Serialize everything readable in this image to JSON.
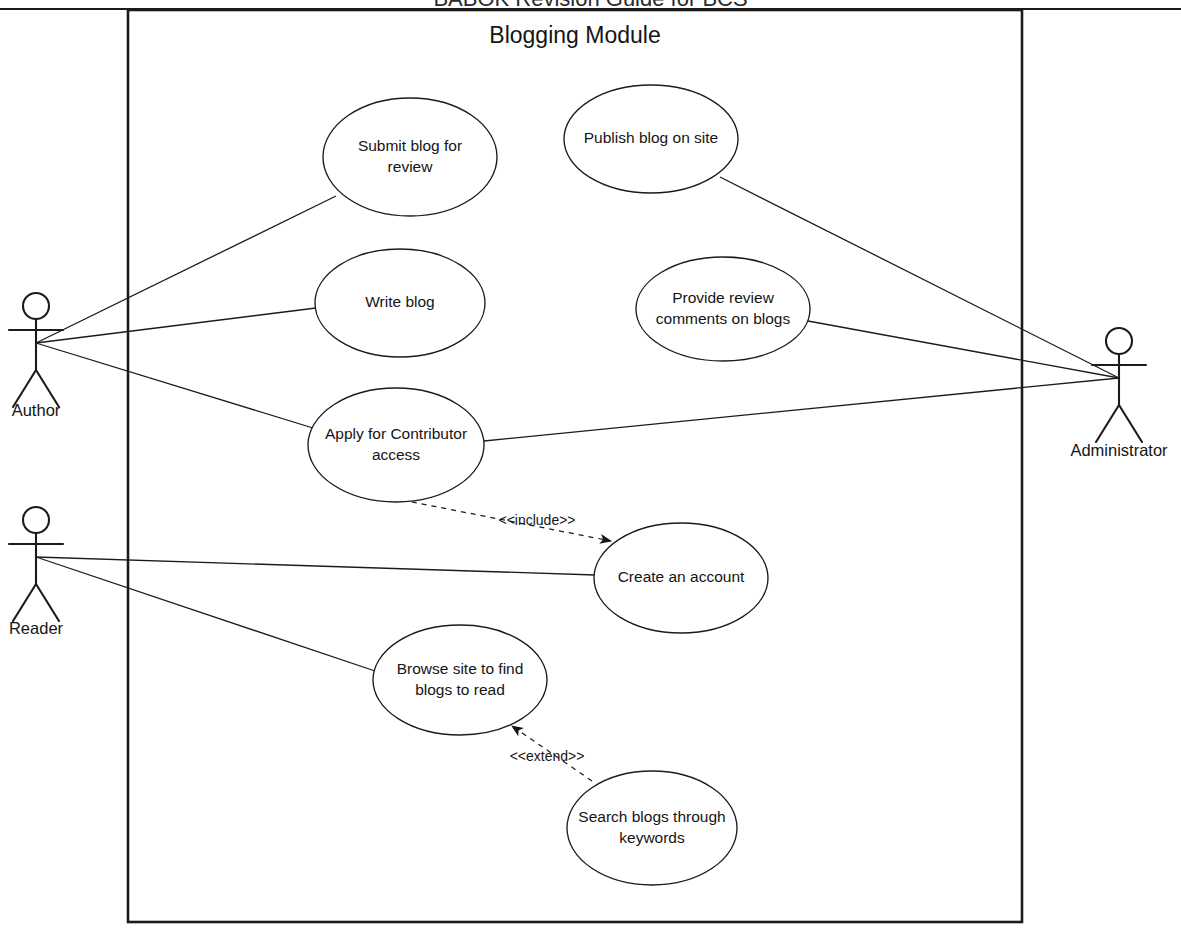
{
  "page": {
    "header_text": "BABOK Revision Guide for BCS",
    "header_visible_note": "cropped at top edge"
  },
  "frame": {
    "title": "Blogging Module",
    "x": 128,
    "y": 10,
    "width": 894,
    "height": 912
  },
  "actors": [
    {
      "id": "author",
      "name": "Author",
      "x": 36,
      "y": 343,
      "label_y": 412
    },
    {
      "id": "reader",
      "name": "Reader",
      "x": 36,
      "y": 557,
      "label_y": 630
    },
    {
      "id": "administrator",
      "name": "Administrator",
      "x": 1119,
      "y": 378,
      "label_y": 452
    }
  ],
  "use_cases": [
    {
      "id": "submit_blog",
      "label_line1": "Submit blog for",
      "label_line2": "review",
      "cx": 410,
      "cy": 157,
      "rx": 87,
      "ry": 59
    },
    {
      "id": "publish_blog",
      "label_line1": "Publish blog on site",
      "label_line2": "",
      "cx": 651,
      "cy": 139,
      "rx": 87,
      "ry": 54
    },
    {
      "id": "write_blog",
      "label_line1": "Write blog",
      "label_line2": "",
      "cx": 400,
      "cy": 303,
      "rx": 85,
      "ry": 54
    },
    {
      "id": "provide_review",
      "label_line1": "Provide review",
      "label_line2": "comments on blogs",
      "cx": 723,
      "cy": 309,
      "rx": 87,
      "ry": 52
    },
    {
      "id": "apply_access",
      "label_line1": "Apply for Contributor",
      "label_line2": "access",
      "cx": 396,
      "cy": 445,
      "rx": 88,
      "ry": 57
    },
    {
      "id": "create_account",
      "label_line1": "Create an account",
      "label_line2": "",
      "cx": 681,
      "cy": 578,
      "rx": 87,
      "ry": 55
    },
    {
      "id": "browse_site",
      "label_line1": "Browse site to find",
      "label_line2": "blogs to read",
      "cx": 460,
      "cy": 680,
      "rx": 87,
      "ry": 55
    },
    {
      "id": "search_blogs",
      "label_line1": "Search blogs through",
      "label_line2": "keywords",
      "cx": 652,
      "cy": 828,
      "rx": 85,
      "ry": 57
    }
  ],
  "associations": [
    {
      "id": "author-submit_blog",
      "from": "author",
      "to": "submit_blog",
      "x1": 36,
      "y1": 343,
      "x2": 336,
      "y2": 196
    },
    {
      "id": "author-write_blog",
      "from": "author",
      "to": "write_blog",
      "x1": 36,
      "y1": 343,
      "x2": 316,
      "y2": 308
    },
    {
      "id": "author-apply_access",
      "from": "author",
      "to": "apply_access",
      "x1": 36,
      "y1": 343,
      "x2": 313,
      "y2": 428
    },
    {
      "id": "administrator-publish_blog",
      "from": "administrator",
      "to": "publish_blog",
      "x1": 1119,
      "y1": 378,
      "x2": 720,
      "y2": 177
    },
    {
      "id": "administrator-provide_review",
      "from": "administrator",
      "to": "provide_review",
      "x1": 1119,
      "y1": 378,
      "x2": 808,
      "y2": 321
    },
    {
      "id": "administrator-apply_access",
      "from": "administrator",
      "to": "apply_access",
      "x1": 1119,
      "y1": 378,
      "x2": 484,
      "y2": 441
    },
    {
      "id": "reader-create_account",
      "from": "reader",
      "to": "create_account",
      "x1": 36,
      "y1": 557,
      "x2": 595,
      "y2": 575
    },
    {
      "id": "reader-browse_site",
      "from": "reader",
      "to": "browse_site",
      "x1": 36,
      "y1": 557,
      "x2": 375,
      "y2": 671
    }
  ],
  "stereotype_relationships": [
    {
      "id": "include-apply-create",
      "label": "<<include>>",
      "type": "include",
      "from": "apply_access",
      "to": "create_account",
      "x1": 402,
      "y1": 500,
      "x2": 611,
      "y2": 541,
      "label_x": 537,
      "label_y": 521
    },
    {
      "id": "extend-search-browse",
      "label": "<<extend>>",
      "type": "extend",
      "from": "search_blogs",
      "to": "browse_site",
      "x1": 592,
      "y1": 781,
      "x2": 512,
      "y2": 726,
      "label_x": 547,
      "label_y": 757
    }
  ],
  "colors": {
    "ink": "#1b1b1b",
    "paper": "#ffffff",
    "text": "#151515"
  }
}
